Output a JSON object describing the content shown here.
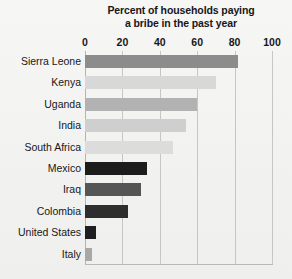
{
  "chart_data": {
    "type": "bar",
    "orientation": "horizontal",
    "title": "Percent of households paying a bribe in the past year",
    "title_lines": [
      "Percent of households paying",
      "a bribe in the past year"
    ],
    "xlabel": "",
    "ylabel": "",
    "xlim": [
      0,
      100
    ],
    "xticks": [
      0,
      20,
      40,
      60,
      80,
      100
    ],
    "xtick_labels": [
      "0",
      "20",
      "40",
      "60",
      "80",
      "100"
    ],
    "grid": "vertical",
    "legend": "none",
    "categories": [
      "Sierra Leone",
      "Kenya",
      "Uganda",
      "India",
      "South Africa",
      "Mexico",
      "Iraq",
      "Colombia",
      "United States",
      "Italy"
    ],
    "values": [
      82,
      70,
      60,
      54,
      47,
      33,
      30,
      23,
      6,
      4
    ],
    "bar_colors": [
      "#8c8c8c",
      "#d8d8d8",
      "#b2b2b2",
      "#cfcfcf",
      "#dcdcdc",
      "#1c1c1c",
      "#555555",
      "#2e2e2e",
      "#1f1f1f",
      "#a8a8a8"
    ]
  },
  "style": {
    "background": "#f3f3f1",
    "text_color": "#17171a",
    "gridline_color": "#c6c6c4",
    "axis_color": "#b9b9b7"
  }
}
